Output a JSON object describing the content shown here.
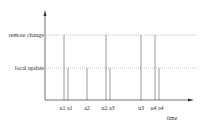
{
  "diagram": {
    "y_levels": [
      {
        "label": "remote change",
        "y": 35
      },
      {
        "label": "local update",
        "y": 68
      }
    ],
    "x_axis_label": "time",
    "events": [
      {
        "name": "u1",
        "x": 64,
        "level": "remote change"
      },
      {
        "name": "a1",
        "x": 68,
        "level": "local update"
      },
      {
        "name": "a2",
        "x": 87,
        "level": "local update"
      },
      {
        "name": "u2",
        "x": 106,
        "level": "remote change"
      },
      {
        "name": "a3",
        "x": 110,
        "level": "local update"
      },
      {
        "name": "u3",
        "x": 141,
        "level": "remote change"
      },
      {
        "name": "u4",
        "x": 155,
        "level": "remote change"
      },
      {
        "name": "a4",
        "x": 159,
        "level": "local update"
      }
    ],
    "tick_labels": [
      {
        "text": "u1 a1",
        "x": 66
      },
      {
        "text": "a2",
        "x": 87
      },
      {
        "text": "u2 a3",
        "x": 108
      },
      {
        "text": "u3",
        "x": 141
      },
      {
        "text": "u4 a4",
        "x": 157
      }
    ],
    "colors": {
      "axis": "#333333",
      "line": "#555555",
      "dotted": "#888888"
    }
  }
}
